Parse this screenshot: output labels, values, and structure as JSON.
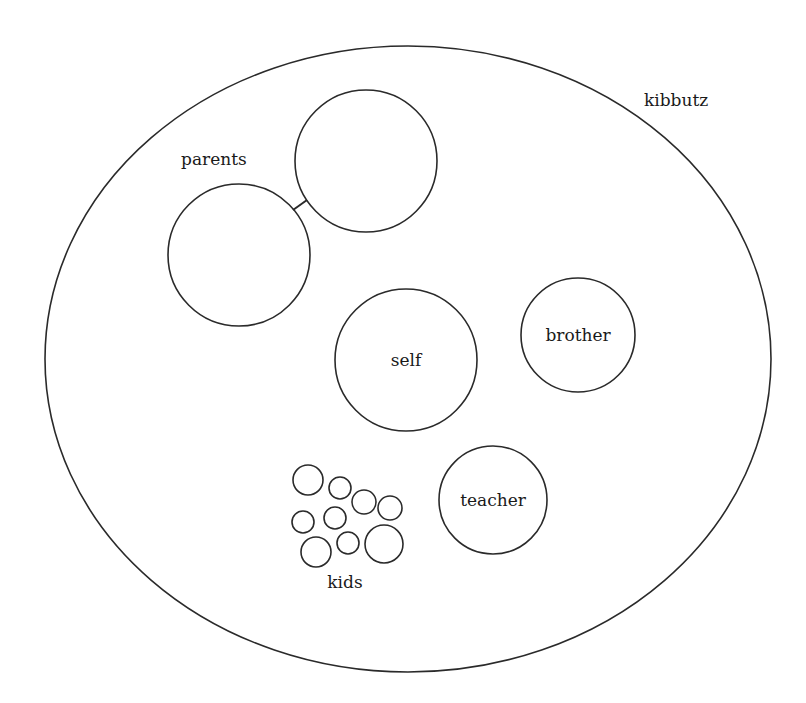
{
  "diagram": {
    "outer": {
      "label": "kibbutz",
      "cx": 408,
      "cy": 359,
      "rx": 363,
      "ry": 313,
      "label_x": 644,
      "label_y": 106
    },
    "parents": {
      "label": "parents",
      "label_x": 181,
      "label_y": 165,
      "circles": [
        {
          "cx": 239,
          "cy": 255,
          "r": 71
        },
        {
          "cx": 366,
          "cy": 161,
          "r": 71
        }
      ],
      "connector": {
        "x1": 293,
        "y1": 210,
        "x2": 307,
        "y2": 200
      }
    },
    "self": {
      "label": "self",
      "cx": 406,
      "cy": 360,
      "r": 71
    },
    "brother": {
      "label": "brother",
      "cx": 578,
      "cy": 335,
      "r": 57
    },
    "teacher": {
      "label": "teacher",
      "cx": 493,
      "cy": 500,
      "r": 54
    },
    "kids": {
      "label": "kids",
      "label_x": 345,
      "label_y": 588,
      "circles": [
        {
          "cx": 308,
          "cy": 480,
          "r": 15
        },
        {
          "cx": 340,
          "cy": 488,
          "r": 11
        },
        {
          "cx": 364,
          "cy": 502,
          "r": 12
        },
        {
          "cx": 390,
          "cy": 508,
          "r": 12
        },
        {
          "cx": 303,
          "cy": 522,
          "r": 11
        },
        {
          "cx": 335,
          "cy": 518,
          "r": 11
        },
        {
          "cx": 316,
          "cy": 552,
          "r": 15
        },
        {
          "cx": 348,
          "cy": 543,
          "r": 11
        },
        {
          "cx": 384,
          "cy": 544,
          "r": 19
        }
      ]
    }
  },
  "colors": {
    "stroke": "#2a2a2a",
    "text": "#1a1a1a",
    "background": "#ffffff"
  }
}
